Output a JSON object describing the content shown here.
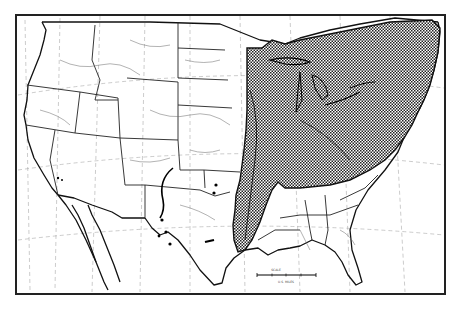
{
  "map": {
    "subject": "Distribution range map of the contiguous United States",
    "region_shaded": "Eastern United States — from eastern Great Plains (Minnesota/Iowa/Missouri/eastern Oklahoma/east Texas) east to the Atlantic coast, north to the Great Lakes and New England, south to the Gulf coast of Texas/Louisiana and northern Georgia/Carolinas",
    "outlier_records": "Scattered dots in central Oklahoma, west/central Texas, and along the Pecos River valley in New Mexico",
    "colors": {
      "background": "#ffffff",
      "lines": "#111111",
      "shading": "#333333"
    },
    "scale_bar": {
      "label_top": "SCALE",
      "label_bottom": "U.S. MILES"
    }
  }
}
